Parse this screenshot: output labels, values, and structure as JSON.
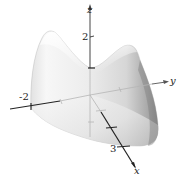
{
  "figure": {
    "type": "3d-surface-plot",
    "axes": {
      "x": {
        "label": "x",
        "tick_label": "3"
      },
      "y": {
        "label": "y",
        "tick_label": "-2"
      },
      "z": {
        "label": "z",
        "tick_label": "2"
      }
    },
    "colors": {
      "surface_light": "#f4f4f4",
      "surface_mid": "#d9d9d9",
      "surface_dark": "#9a9a9a",
      "axis": "#333333",
      "hidden_axis": "#b5b5b5"
    }
  }
}
